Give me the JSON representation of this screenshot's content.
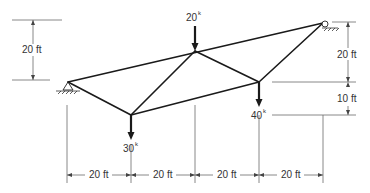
{
  "diagram": {
    "type": "truss",
    "nodes": {
      "A": {
        "x": 68,
        "y": 82,
        "support": "pin"
      },
      "B": {
        "x": 131,
        "y": 115
      },
      "C": {
        "x": 195,
        "y": 51
      },
      "D": {
        "x": 259,
        "y": 82
      },
      "E": {
        "x": 323,
        "y": 23,
        "support": "roller"
      }
    },
    "members": [
      [
        "A",
        "E"
      ],
      [
        "A",
        "C"
      ],
      [
        "A",
        "B"
      ],
      [
        "B",
        "C"
      ],
      [
        "B",
        "D"
      ],
      [
        "C",
        "D"
      ],
      [
        "D",
        "E"
      ]
    ],
    "loads": [
      {
        "node": "C",
        "value": "20",
        "unit": "k",
        "direction": "down"
      },
      {
        "node": "B",
        "value": "30",
        "unit": "k",
        "direction": "down"
      },
      {
        "node": "D",
        "value": "40",
        "unit": "k",
        "direction": "down"
      }
    ],
    "dimensions": {
      "left_vertical": "20 ft",
      "right_upper_vertical": "20 ft",
      "right_lower_vertical": "10 ft",
      "horizontal": [
        "20 ft",
        "20 ft",
        "20 ft",
        "20 ft"
      ]
    }
  }
}
